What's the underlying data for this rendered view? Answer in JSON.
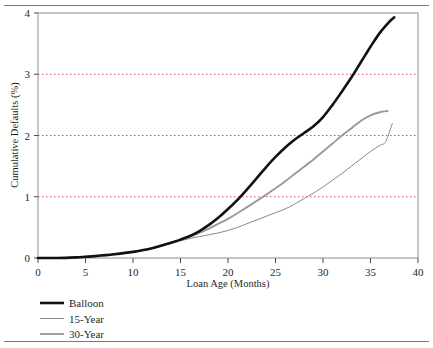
{
  "chart_data": {
    "type": "line",
    "title": "",
    "xlabel": "Loan Age (Months)",
    "ylabel": "Cumulative Defaults (%)",
    "xlim": [
      0,
      40
    ],
    "ylim": [
      0,
      4
    ],
    "xticks": [
      0,
      5,
      10,
      15,
      20,
      25,
      30,
      35,
      40
    ],
    "yticks": [
      0,
      1,
      2,
      3,
      4
    ],
    "xtick_labels": [
      "0",
      "5",
      "10",
      "15",
      "20",
      "25",
      "30",
      "35",
      "40"
    ],
    "ytick_labels": [
      "0",
      "1",
      "2",
      "3",
      "4"
    ],
    "grid": "horizontal-dotted-at-1-2-3",
    "legend_position": "below-plot-left",
    "series": [
      {
        "name": "Balloon",
        "color": "#111111",
        "width": 2.6,
        "x": [
          0,
          2,
          4,
          5,
          6,
          8,
          10,
          12,
          14,
          15,
          16,
          17,
          18,
          19,
          20,
          21,
          22,
          23,
          24,
          25,
          26,
          27,
          28,
          29,
          30,
          31,
          32,
          33,
          34,
          35,
          36,
          37,
          37.5
        ],
        "y": [
          0,
          0,
          0.01,
          0.02,
          0.03,
          0.06,
          0.1,
          0.16,
          0.25,
          0.3,
          0.36,
          0.44,
          0.54,
          0.66,
          0.8,
          0.95,
          1.12,
          1.3,
          1.48,
          1.65,
          1.8,
          1.93,
          2.04,
          2.15,
          2.3,
          2.5,
          2.72,
          2.95,
          3.2,
          3.45,
          3.68,
          3.86,
          3.93
        ]
      },
      {
        "name": "15-Year",
        "color": "#8a8a8a",
        "width": 1.0,
        "x": [
          0,
          2,
          4,
          5,
          6,
          8,
          10,
          12,
          14,
          15,
          16,
          17,
          18,
          19,
          20,
          21,
          22,
          23,
          24,
          25,
          26,
          27,
          28,
          29,
          30,
          31,
          32,
          33,
          34,
          35,
          36,
          36.6,
          37.3
        ],
        "y": [
          0,
          0,
          0.01,
          0.02,
          0.03,
          0.06,
          0.1,
          0.16,
          0.24,
          0.28,
          0.32,
          0.35,
          0.38,
          0.41,
          0.45,
          0.5,
          0.56,
          0.62,
          0.68,
          0.74,
          0.8,
          0.88,
          0.97,
          1.06,
          1.16,
          1.27,
          1.38,
          1.5,
          1.62,
          1.74,
          1.84,
          1.9,
          2.2
        ]
      },
      {
        "name": "30-Year",
        "color": "#9a9a9a",
        "width": 1.9,
        "x": [
          0,
          2,
          4,
          5,
          6,
          8,
          10,
          12,
          14,
          15,
          16,
          17,
          18,
          19,
          20,
          21,
          22,
          23,
          24,
          25,
          26,
          27,
          28,
          29,
          30,
          31,
          32,
          33,
          34,
          35,
          36,
          36.8
        ],
        "y": [
          0,
          0,
          0.01,
          0.02,
          0.03,
          0.06,
          0.1,
          0.16,
          0.25,
          0.3,
          0.35,
          0.41,
          0.48,
          0.56,
          0.64,
          0.73,
          0.83,
          0.93,
          1.03,
          1.14,
          1.25,
          1.37,
          1.49,
          1.61,
          1.74,
          1.87,
          2.0,
          2.12,
          2.24,
          2.33,
          2.38,
          2.4
        ]
      }
    ]
  },
  "legend": {
    "items": [
      {
        "label": "Balloon"
      },
      {
        "label": "15-Year"
      },
      {
        "label": "30-Year"
      }
    ]
  }
}
